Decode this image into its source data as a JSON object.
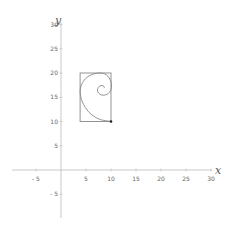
{
  "chart_data": {
    "type": "line",
    "title": "",
    "xlabel": "x",
    "ylabel": "y",
    "xlim": [
      -10,
      30
    ],
    "ylim": [
      -10,
      30
    ],
    "grid": false,
    "x_ticks": [
      -5,
      5,
      10,
      15,
      20,
      25,
      30
    ],
    "y_ticks": [
      -5,
      5,
      10,
      15,
      20,
      25,
      30
    ],
    "x_tick_labels": [
      "- 5",
      "5",
      "10",
      "15",
      "20",
      "25",
      "30"
    ],
    "y_tick_labels": [
      "- 5",
      "5",
      "10",
      "15",
      "20",
      "25",
      "30"
    ],
    "shapes": [
      {
        "name": "golden-rectangle",
        "type": "rectangle",
        "x0": 3.82,
        "y0": 10,
        "x1": 10,
        "y1": 20
      },
      {
        "name": "golden-spiral",
        "type": "spiral",
        "start": [
          10,
          10
        ],
        "points": [
          [
            10,
            10
          ],
          [
            7.6,
            10.5
          ],
          [
            5.6,
            11.9
          ],
          [
            4.3,
            14.0
          ],
          [
            3.82,
            16.18
          ],
          [
            4.3,
            18.0
          ],
          [
            5.6,
            19.4
          ],
          [
            7.6,
            20.0
          ],
          [
            9.1,
            19.6
          ],
          [
            10,
            18.2
          ],
          [
            10,
            16.6
          ],
          [
            9.2,
            15.6
          ],
          [
            8.0,
            15.5
          ],
          [
            7.3,
            16.3
          ],
          [
            7.6,
            17.2
          ],
          [
            8.4,
            17.4
          ],
          [
            8.7,
            16.9
          ]
        ]
      },
      {
        "name": "start-point",
        "type": "point",
        "x": 10,
        "y": 10
      }
    ]
  },
  "colors": {
    "axis": "#bbbbbb",
    "shape": "#888888",
    "point": "#222222"
  }
}
